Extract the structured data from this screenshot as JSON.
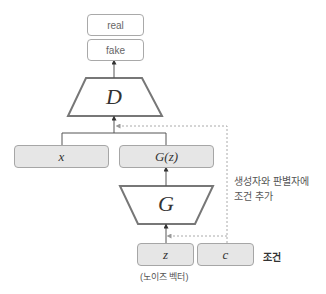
{
  "outputs": {
    "real": "real",
    "fake": "fake"
  },
  "discriminator": {
    "label": "D"
  },
  "generator": {
    "label": "G"
  },
  "inputs": {
    "x": "x",
    "gz": "G(z)",
    "z": "z",
    "c": "c"
  },
  "annotations": {
    "noise_vector": "(노이즈 벡터)",
    "condition": "조건",
    "condition_note_line1": "생성자와 판별자에",
    "condition_note_line2": "조건 추가"
  },
  "colors": {
    "box_fill": "#e6e6e6",
    "box_border": "#a6a6a6",
    "trapezoid_border": "#777777",
    "line": "#555555",
    "dashed": "#aaaaaa"
  }
}
